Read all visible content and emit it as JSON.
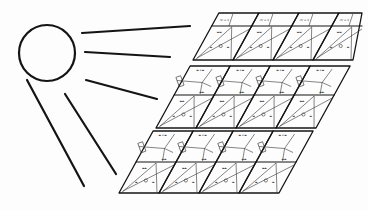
{
  "diagram": {
    "title": "Sun irradiating a tiled solar panel array",
    "colors": {
      "ink": "#141414",
      "background": "#fdfdfd",
      "detail": "#333333"
    },
    "sun": {
      "cx": 47,
      "cy": 53,
      "r": 28,
      "stroke_width": 2.2
    },
    "rays": [
      {
        "x1": 82,
        "y1": 33,
        "x2": 190,
        "y2": 26
      },
      {
        "x1": 85,
        "y1": 52,
        "x2": 170,
        "y2": 57
      },
      {
        "x1": 86,
        "y1": 80,
        "x2": 157,
        "y2": 99
      },
      {
        "x1": 65,
        "y1": 94,
        "x2": 116,
        "y2": 174
      },
      {
        "x1": 27,
        "y1": 80,
        "x2": 84,
        "y2": 186
      }
    ],
    "panel": {
      "slant": 0.55,
      "tile_width": 40,
      "bands": [
        {
          "name": "top",
          "y_top": 13,
          "y_mid": 26,
          "y_bottom": 60,
          "x_left_bottom": 193,
          "tiles": 4,
          "mid_tile_style": "triangle"
        },
        {
          "name": "middle",
          "y_top": 66,
          "y_mid": 95,
          "y_bottom": 128,
          "x_left_bottom": 156,
          "tiles": 4,
          "mid_tile_style": "mosaic"
        },
        {
          "name": "bottom",
          "y_top": 131,
          "y_mid": 162,
          "y_bottom": 193,
          "x_left_bottom": 119,
          "tiles": 4,
          "mid_tile_style": "mosaic"
        }
      ]
    }
  }
}
